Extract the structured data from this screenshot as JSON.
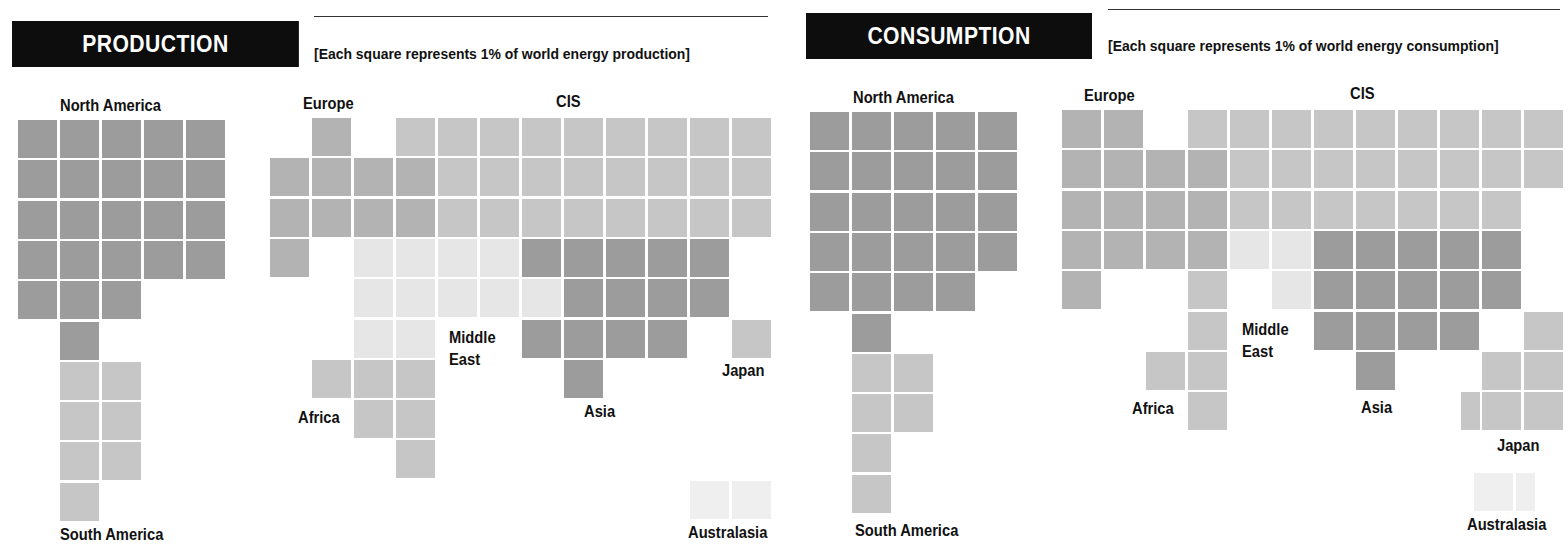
{
  "production": {
    "title": "PRODUCTION",
    "note": "[Each square represents 1% of world energy production]",
    "labels": {
      "north_america": "North America",
      "south_america": "South America",
      "europe": "Europe",
      "cis": "CIS",
      "middle_east_1": "Middle",
      "middle_east_2": "East",
      "africa": "Africa",
      "asia": "Asia",
      "japan": "Japan",
      "australasia": "Australasia"
    }
  },
  "consumption": {
    "title": "CONSUMPTION",
    "note": "[Each square represents 1% of world energy consumption]",
    "labels": {
      "north_america": "North America",
      "south_america": "South America",
      "europe": "Europe",
      "cis": "CIS",
      "middle_east_1": "Middle",
      "middle_east_2": "East",
      "africa": "Africa",
      "asia": "Asia",
      "japan": "Japan",
      "australasia": "Australasia"
    }
  },
  "colors": {
    "north_america": "#9c9c9c",
    "asia": "#9c9c9c",
    "europe": "#b3b3b3",
    "cis": "#c6c6c6",
    "south_america": "#c6c6c6",
    "africa": "#c6c6c6",
    "japan": "#c6c6c6",
    "middle_east": "#e6e6e6",
    "australasia": "#efefef",
    "banner": "#0d0d0d"
  },
  "chart_data": [
    {
      "type": "waffle",
      "title": "PRODUCTION",
      "subtitle": "[Each square represents 1% of world energy production]",
      "unit": "% of world energy production",
      "categories": [
        "North America",
        "South America",
        "Europe",
        "CIS",
        "Middle East",
        "Africa",
        "Asia",
        "Japan",
        "Australasia"
      ],
      "values": [
        24,
        7,
        10,
        25,
        11,
        6,
        14,
        1,
        2
      ]
    },
    {
      "type": "waffle",
      "title": "CONSUMPTION",
      "subtitle": "[Each square represents 1% of world energy consumption]",
      "unit": "% of world energy consumption",
      "categories": [
        "North America",
        "South America",
        "Europe",
        "CIS",
        "Middle East",
        "Africa",
        "Asia",
        "Japan",
        "Australasia"
      ],
      "values": [
        25,
        6,
        15,
        24,
        3,
        5,
        15,
        5.5,
        1.5
      ]
    }
  ],
  "grids": {
    "production": {
      "north_america": {
        "x0": 18,
        "y0": 120,
        "rows": [
          [
            0,
            0,
            5
          ],
          [
            1,
            0,
            5
          ],
          [
            2,
            0,
            5
          ],
          [
            3,
            0,
            5
          ],
          [
            4,
            0,
            3
          ],
          [
            5,
            1,
            1
          ]
        ]
      },
      "south_america": {
        "x0": 18,
        "y0": 120,
        "rows": [
          [
            6,
            1,
            2
          ],
          [
            7,
            1,
            2
          ],
          [
            8,
            1,
            2
          ],
          [
            9,
            1,
            1
          ]
        ]
      },
      "europe": {
        "x0": 270,
        "y0": 118,
        "rows": [
          [
            0,
            1,
            1
          ],
          [
            1,
            0,
            4
          ],
          [
            2,
            0,
            4
          ],
          [
            3,
            0,
            1
          ]
        ]
      },
      "cis": {
        "x0": 270,
        "y0": 118,
        "rows": [
          [
            0,
            3,
            9
          ],
          [
            1,
            4,
            8
          ],
          [
            2,
            4,
            8
          ]
        ]
      },
      "middle_east": {
        "x0": 270,
        "y0": 118,
        "rows": [
          [
            3,
            2,
            4
          ],
          [
            4,
            2,
            5
          ],
          [
            5,
            2,
            2
          ]
        ]
      },
      "asia": {
        "x0": 270,
        "y0": 118,
        "rows": [
          [
            3,
            6,
            5
          ],
          [
            4,
            7,
            4
          ],
          [
            5,
            6,
            4
          ],
          [
            6,
            7,
            1
          ]
        ]
      },
      "africa": {
        "x0": 270,
        "y0": 118,
        "rows": [
          [
            6,
            1,
            3
          ],
          [
            7,
            2,
            2
          ],
          [
            8,
            3,
            1
          ]
        ]
      },
      "japan": {
        "x0": 270,
        "y0": 118,
        "rows": [
          [
            5,
            11,
            1
          ]
        ]
      },
      "australasia": {
        "x0": 270,
        "y0": 118,
        "rows": [
          [
            9,
            10,
            2
          ]
        ]
      }
    },
    "consumption": {
      "north_america": {
        "x0": 810,
        "y0": 112,
        "rows": [
          [
            0,
            0,
            5
          ],
          [
            1,
            0,
            5
          ],
          [
            2,
            0,
            5
          ],
          [
            3,
            0,
            5
          ],
          [
            4,
            0,
            4
          ],
          [
            5,
            1,
            1
          ]
        ]
      },
      "south_america": {
        "x0": 810,
        "y0": 112,
        "rows": [
          [
            6,
            1,
            2
          ],
          [
            7,
            1,
            2
          ],
          [
            8,
            1,
            1
          ],
          [
            9,
            1,
            1
          ]
        ]
      },
      "europe": {
        "x0": 1062,
        "y0": 110,
        "rows": [
          [
            0,
            0,
            2
          ],
          [
            1,
            0,
            4
          ],
          [
            2,
            0,
            4
          ],
          [
            3,
            0,
            4
          ],
          [
            4,
            0,
            1
          ]
        ]
      },
      "cis": {
        "x0": 1062,
        "y0": 110,
        "rows": [
          [
            0,
            3,
            9
          ],
          [
            1,
            4,
            8
          ],
          [
            2,
            4,
            7
          ]
        ]
      },
      "middle_east": {
        "x0": 1062,
        "y0": 110,
        "rows": [
          [
            3,
            4,
            2
          ],
          [
            4,
            5,
            1
          ]
        ]
      },
      "asia": {
        "x0": 1062,
        "y0": 110,
        "rows": [
          [
            3,
            6,
            5
          ],
          [
            4,
            6,
            5
          ],
          [
            5,
            6,
            4
          ],
          [
            6,
            7,
            1
          ]
        ]
      },
      "africa": {
        "x0": 1062,
        "y0": 110,
        "rows": [
          [
            4,
            3,
            1
          ],
          [
            5,
            3,
            1
          ],
          [
            6,
            2,
            2
          ],
          [
            7,
            3,
            1
          ]
        ]
      },
      "japan": {
        "x0": 1062,
        "y0": 110,
        "rows": [
          [
            5,
            11,
            1
          ],
          [
            6,
            10,
            2
          ],
          [
            7,
            10,
            2
          ]
        ],
        "half": [
          [
            7,
            9.5
          ]
        ]
      },
      "australasia": {
        "x0": 1062,
        "y0": 110,
        "rows": [
          [
            9,
            9.8,
            1
          ]
        ],
        "half": [
          [
            9,
            10.8
          ]
        ]
      }
    }
  }
}
